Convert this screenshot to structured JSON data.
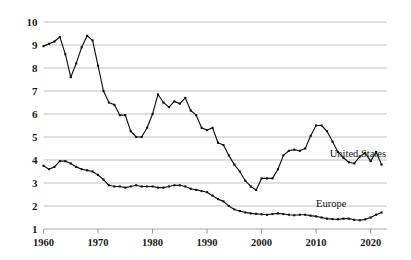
{
  "chart_data": {
    "type": "line",
    "title": "",
    "subtitle": "",
    "xlabel": "",
    "ylabel": "",
    "xlim": [
      1960,
      2023
    ],
    "ylim": [
      1,
      10
    ],
    "xticks": [
      1960,
      1970,
      1980,
      1990,
      2000,
      2010,
      2020
    ],
    "yticks": [
      1,
      2,
      3,
      4,
      5,
      6,
      7,
      8,
      9,
      10
    ],
    "grid": true,
    "legend_position": "inline-right",
    "markers": true,
    "line_color": "#111111",
    "grid_color": "#b9b9b9",
    "annotations": [
      {
        "text": "United States",
        "x": 2012.5,
        "y": 4.15
      },
      {
        "text": "Europe",
        "x": 2010.0,
        "y": 1.95
      }
    ],
    "series": [
      {
        "name": "United States",
        "label": "United States",
        "x": [
          1960,
          1961,
          1962,
          1963,
          1964,
          1965,
          1966,
          1967,
          1968,
          1969,
          1970,
          1971,
          1972,
          1973,
          1974,
          1975,
          1976,
          1977,
          1978,
          1979,
          1980,
          1981,
          1982,
          1983,
          1984,
          1985,
          1986,
          1987,
          1988,
          1989,
          1990,
          1991,
          1992,
          1993,
          1994,
          1995,
          1996,
          1997,
          1998,
          1999,
          2000,
          2001,
          2002,
          2003,
          2004,
          2005,
          2006,
          2007,
          2008,
          2009,
          2010,
          2011,
          2012,
          2013,
          2014,
          2015,
          2016,
          2017,
          2018,
          2019,
          2020,
          2021,
          2022
        ],
        "values": [
          8.95,
          9.05,
          9.15,
          9.35,
          8.6,
          7.6,
          8.2,
          8.9,
          9.4,
          9.2,
          8.1,
          7.0,
          6.5,
          6.4,
          5.95,
          5.95,
          5.25,
          5.0,
          5.0,
          5.4,
          6.0,
          6.85,
          6.5,
          6.3,
          6.55,
          6.45,
          6.7,
          6.15,
          5.95,
          5.4,
          5.3,
          5.4,
          4.75,
          4.65,
          4.2,
          3.8,
          3.5,
          3.1,
          2.85,
          2.7,
          3.2,
          3.2,
          3.2,
          3.6,
          4.2,
          4.4,
          4.45,
          4.4,
          4.5,
          5.05,
          5.5,
          5.5,
          5.25,
          4.8,
          4.35,
          4.1,
          3.9,
          3.85,
          4.15,
          4.3,
          3.95,
          4.35,
          3.8
        ]
      },
      {
        "name": "Europe",
        "label": "Europe",
        "x": [
          1960,
          1961,
          1962,
          1963,
          1964,
          1965,
          1966,
          1967,
          1968,
          1969,
          1970,
          1971,
          1972,
          1973,
          1974,
          1975,
          1976,
          1977,
          1978,
          1979,
          1980,
          1981,
          1982,
          1983,
          1984,
          1985,
          1986,
          1987,
          1988,
          1989,
          1990,
          1991,
          1992,
          1993,
          1994,
          1995,
          1996,
          1997,
          1998,
          1999,
          2000,
          2001,
          2002,
          2003,
          2004,
          2005,
          2006,
          2007,
          2008,
          2009,
          2010,
          2011,
          2012,
          2013,
          2014,
          2015,
          2016,
          2017,
          2018,
          2019,
          2020,
          2021,
          2022
        ],
        "values": [
          3.75,
          3.6,
          3.7,
          3.95,
          3.95,
          3.85,
          3.7,
          3.6,
          3.55,
          3.5,
          3.35,
          3.15,
          2.9,
          2.85,
          2.85,
          2.8,
          2.85,
          2.9,
          2.85,
          2.85,
          2.85,
          2.8,
          2.8,
          2.85,
          2.9,
          2.9,
          2.85,
          2.75,
          2.7,
          2.65,
          2.6,
          2.45,
          2.3,
          2.2,
          2.0,
          1.85,
          1.78,
          1.72,
          1.68,
          1.66,
          1.64,
          1.62,
          1.65,
          1.68,
          1.65,
          1.62,
          1.6,
          1.62,
          1.62,
          1.58,
          1.55,
          1.5,
          1.45,
          1.43,
          1.42,
          1.45,
          1.45,
          1.4,
          1.38,
          1.42,
          1.5,
          1.62,
          1.72
        ]
      }
    ]
  }
}
